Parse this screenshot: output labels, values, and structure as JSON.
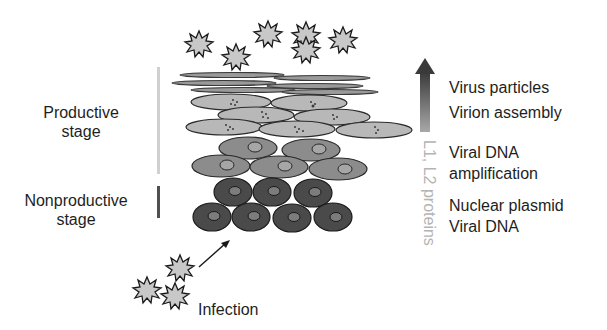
{
  "diagram": {
    "stages": {
      "productive": {
        "label_line1": "Productive",
        "label_line2": "stage",
        "bar_color": "#d0d0d0"
      },
      "nonproductive": {
        "label_line1": "Nonproductive",
        "label_line2": "stage",
        "bar_color": "#505050"
      }
    },
    "right_labels": {
      "virus_particles": "Virus particles",
      "virion_assembly": "Virion assembly",
      "viral_dna_line1": "Viral DNA",
      "viral_dna_line2": "amplification",
      "nuclear_plasmid": "Nuclear plasmid",
      "viral_dna_basal": "Viral DNA"
    },
    "vertical_label": "L1, L2 proteins",
    "infection_label": "Infection",
    "colors": {
      "squame": "#6a6a6a",
      "upper_cell": "#b8b8b8",
      "mid_cell": "#8c8c8c",
      "basal_cell": "#4a4a4a",
      "nucleus_mid": "#a6a6a6",
      "nucleus_basal": "#7c7c7c",
      "virus": "#c8c8c8",
      "arrow_top": "#3a3a3a",
      "arrow_bottom": "#a8a8a8"
    }
  }
}
